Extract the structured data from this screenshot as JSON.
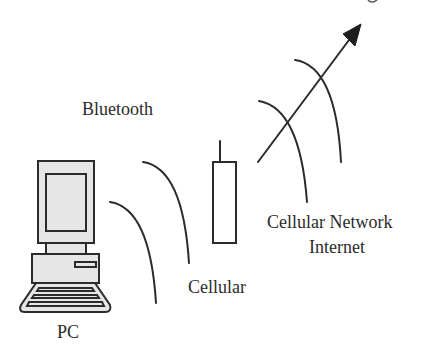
{
  "diagram": {
    "type": "wireless-communication-illustration",
    "nodes": [
      {
        "id": "pc",
        "label": "PC",
        "icon": "desktop-computer-icon"
      },
      {
        "id": "phone",
        "label": "",
        "icon": "cell-phone-icon"
      }
    ],
    "labels": {
      "bluetooth": "Bluetooth",
      "cellular": "Cellular",
      "cellular_network": "Cellular Network",
      "internet": "Internet",
      "pc": "PC"
    },
    "links": [
      {
        "from": "pc",
        "to": "phone",
        "medium": "Bluetooth",
        "style": "radio-wave-arcs"
      },
      {
        "from": "phone",
        "to": "network",
        "medium": "Cellular",
        "style": "radio-wave-arcs"
      },
      {
        "from": "phone",
        "to": "Cellular Network / Internet",
        "style": "arrow"
      }
    ],
    "colors": {
      "stroke": "#2b2b2b",
      "fill": "#e6e6e6",
      "background": "#ffffff"
    }
  }
}
